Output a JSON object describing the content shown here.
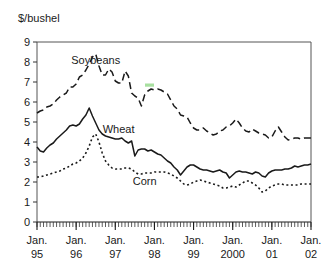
{
  "chart_data": {
    "type": "line",
    "title": "",
    "subtitle": "",
    "xlabel": "",
    "ylabel": "$/bushel",
    "ylim": [
      0,
      9
    ],
    "yticks": [
      0,
      1,
      2,
      3,
      4,
      5,
      6,
      7,
      8,
      9
    ],
    "ytick_labels": [
      "0",
      "1",
      "2",
      "3",
      "4",
      "5",
      "6",
      "7",
      "8",
      "9"
    ],
    "grid": false,
    "legend_position": "inline-annotations",
    "x_axis": {
      "type": "monthly",
      "start": "1995-01",
      "end": "2002-01",
      "minor_tick_interval_months": 1,
      "major_ticks": [
        {
          "label_line1": "Jan.",
          "label_line2": "95",
          "x": "1995-01"
        },
        {
          "label_line1": "Jan.",
          "label_line2": "96",
          "x": "1996-01"
        },
        {
          "label_line1": "Jan.",
          "label_line2": "97",
          "x": "1997-01"
        },
        {
          "label_line1": "Jan.",
          "label_line2": "98",
          "x": "1998-01"
        },
        {
          "label_line1": "Jan.",
          "label_line2": "99",
          "x": "1999-01"
        },
        {
          "label_line1": "Jan.",
          "label_line2": "2000",
          "x": "2000-01"
        },
        {
          "label_line1": "Jan.",
          "label_line2": "01",
          "x": "2001-01"
        },
        {
          "label_line1": "Jan.",
          "label_line2": "02",
          "x": "2002-01"
        }
      ]
    },
    "series": [
      {
        "name": "Soybeans",
        "style": "dashed",
        "color": "#1a1a1a",
        "label_x": "1996-07",
        "label_y": 7.9,
        "values": [
          5.45,
          5.55,
          5.6,
          5.75,
          5.8,
          5.9,
          6.1,
          6.25,
          6.35,
          6.45,
          6.75,
          6.75,
          6.9,
          7.25,
          7.35,
          7.6,
          7.9,
          8.25,
          8.4,
          7.8,
          7.35,
          7.35,
          7.65,
          7.5,
          7.05,
          6.95,
          6.95,
          7.55,
          7.3,
          6.45,
          6.3,
          6.2,
          5.8,
          6.35,
          6.55,
          6.65,
          6.6,
          6.65,
          6.6,
          6.5,
          6.4,
          6.1,
          5.8,
          5.65,
          5.35,
          5.3,
          5.25,
          4.95,
          4.7,
          4.6,
          4.6,
          4.7,
          4.55,
          4.45,
          4.35,
          4.4,
          4.55,
          4.6,
          4.75,
          4.8,
          4.95,
          5.15,
          4.95,
          4.7,
          4.55,
          4.5,
          4.65,
          4.55,
          4.45,
          4.4,
          4.35,
          4.2,
          4.25,
          4.55,
          4.75,
          4.5,
          4.25,
          4.1,
          4.15,
          4.2,
          4.2,
          4.15,
          4.2,
          4.2,
          4.2
        ]
      },
      {
        "name": "Wheat",
        "style": "solid",
        "color": "#1a1a1a",
        "label_x": "1997-02",
        "label_y": 4.45,
        "values": [
          3.75,
          3.55,
          3.5,
          3.7,
          3.85,
          3.95,
          4.15,
          4.3,
          4.45,
          4.6,
          4.8,
          4.85,
          4.8,
          4.9,
          5.15,
          5.35,
          5.7,
          5.3,
          4.95,
          4.6,
          4.4,
          4.3,
          4.25,
          4.2,
          4.15,
          4.15,
          4.2,
          4.05,
          3.95,
          4.05,
          3.3,
          3.6,
          3.65,
          3.65,
          3.55,
          3.6,
          3.5,
          3.4,
          3.35,
          3.2,
          3.05,
          2.95,
          2.75,
          2.6,
          2.35,
          2.55,
          2.75,
          2.85,
          2.85,
          2.75,
          2.65,
          2.6,
          2.6,
          2.55,
          2.5,
          2.55,
          2.6,
          2.5,
          2.45,
          2.2,
          2.35,
          2.5,
          2.55,
          2.5,
          2.5,
          2.45,
          2.4,
          2.5,
          2.45,
          2.3,
          2.25,
          2.45,
          2.55,
          2.6,
          2.6,
          2.6,
          2.65,
          2.65,
          2.7,
          2.8,
          2.75,
          2.8,
          2.85,
          2.85,
          2.9
        ]
      },
      {
        "name": "Corn",
        "style": "dotted",
        "color": "#1a1a1a",
        "label_x": "1997-10",
        "label_y": 1.85,
        "values": [
          2.25,
          2.25,
          2.3,
          2.35,
          2.4,
          2.45,
          2.5,
          2.55,
          2.65,
          2.7,
          2.8,
          2.9,
          2.95,
          3.05,
          3.2,
          3.45,
          3.8,
          4.25,
          4.4,
          4.0,
          3.45,
          3.05,
          2.85,
          2.7,
          2.65,
          2.65,
          2.65,
          2.7,
          2.7,
          2.65,
          2.5,
          2.4,
          2.4,
          2.45,
          2.45,
          2.45,
          2.5,
          2.5,
          2.5,
          2.5,
          2.45,
          2.4,
          2.3,
          2.2,
          2.05,
          1.9,
          1.85,
          1.9,
          2.0,
          2.05,
          2.1,
          2.05,
          2.0,
          1.95,
          1.9,
          1.85,
          1.8,
          1.7,
          1.7,
          1.75,
          1.8,
          1.75,
          1.85,
          1.95,
          2.05,
          2.05,
          1.95,
          1.85,
          1.7,
          1.5,
          1.55,
          1.7,
          1.8,
          1.85,
          1.9,
          1.9,
          1.85,
          1.85,
          1.85,
          1.85,
          1.85,
          1.9,
          1.9,
          1.9,
          1.9
        ]
      }
    ]
  },
  "artifact": {
    "name": "green-highlight-mark",
    "color": "#a8e0a0"
  }
}
